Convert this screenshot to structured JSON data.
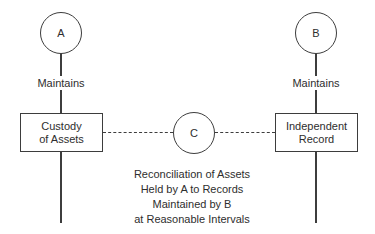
{
  "diagram": {
    "colors": {
      "background": "#ffffff",
      "line": "#3d3d3d",
      "text": "#2e2e2e"
    },
    "entities": {
      "a": "A",
      "b": "B",
      "c": "C"
    },
    "edge_labels": {
      "left_maintains": "Maintains",
      "right_maintains": "Maintains"
    },
    "boxes": {
      "custody": {
        "line1": "Custody",
        "line2": "of Assets"
      },
      "independent": {
        "line1": "Independent",
        "line2": "Record"
      }
    },
    "caption": {
      "lines": [
        "Reconciliation of Assets",
        "Held by A to Records",
        "Maintained by B",
        "at Reasonable Intervals"
      ]
    }
  }
}
